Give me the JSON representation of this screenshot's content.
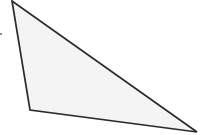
{
  "figure": {
    "canvas": {
      "width": 200,
      "height": 135,
      "background": "#ffffff"
    },
    "style": {
      "fill_color": "#f4f4f4",
      "stroke_color": "#2b2b2b",
      "stroke_width": 1.7,
      "stroke_linejoin": "miter"
    },
    "shape": {
      "name": "scalene-triangle",
      "type": "polygon",
      "sides": 3,
      "points": "12,1 30,110 197,132",
      "vertices": [
        {
          "label": "A",
          "x": 12,
          "y": 1
        },
        {
          "label": "B",
          "x": 30,
          "y": 110
        },
        {
          "label": "C",
          "x": 197,
          "y": 132
        }
      ],
      "edges": [
        {
          "label": "AB",
          "from": "A",
          "to": "B"
        },
        {
          "label": "BC",
          "from": "B",
          "to": "C"
        },
        {
          "label": "CA",
          "from": "C",
          "to": "A"
        }
      ]
    },
    "marks": [
      {
        "name": "left-edge-tick",
        "x": 0,
        "y": 33,
        "color": "#6e6e6e"
      }
    ]
  }
}
